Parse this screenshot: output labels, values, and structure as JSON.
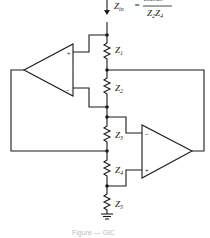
{
  "diagram": {
    "formula": {
      "lhs": "Z",
      "lhs_sub": "in",
      "equals": "=",
      "numerator": "Z1Z3Z5",
      "denominator_parts": [
        {
          "letter": "Z",
          "sub": "2"
        },
        {
          "letter": "Z",
          "sub": "4"
        }
      ]
    },
    "impedances": [
      {
        "letter": "Z",
        "sub": "1"
      },
      {
        "letter": "Z",
        "sub": "2"
      },
      {
        "letter": "Z",
        "sub": "3"
      },
      {
        "letter": "Z",
        "sub": "4"
      },
      {
        "letter": "Z",
        "sub": "5"
      }
    ],
    "opamps": [
      {
        "name": "left-opamp",
        "plus": "+",
        "minus": "−"
      },
      {
        "name": "right-opamp",
        "plus": "+",
        "minus": "−"
      }
    ],
    "caption": "Figure — GIC"
  }
}
